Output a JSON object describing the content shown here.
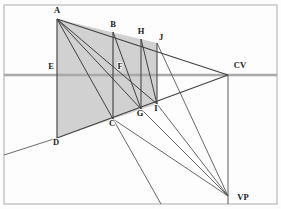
{
  "figure": {
    "type": "perspective-construction-diagram",
    "canvas": {
      "width": 281,
      "height": 209
    },
    "frame": {
      "x": 4,
      "y": 5,
      "width": 273,
      "height": 199,
      "stroke": "#b9b9b9"
    },
    "colors": {
      "background": "#fdfdfd",
      "line": "#4a4a4a",
      "thin_line": "#6d6d6d",
      "horizon": "#a8a8a8",
      "shade_fill": "#c9c9c9",
      "label": "#1a1a1a",
      "frame": "#b9b9b9"
    },
    "horizon_line": {
      "label": "horizon",
      "y": 75,
      "x1": 4,
      "x2": 277
    }
  },
  "points": {
    "A": {
      "label": "A",
      "x": 57,
      "y": 19,
      "label_x": 57,
      "label_y": 11
    },
    "B": {
      "label": "B",
      "x": 113,
      "y": 32,
      "label_x": 113,
      "label_y": 26
    },
    "H": {
      "label": "H",
      "x": 141,
      "y": 39,
      "label_x": 141,
      "label_y": 33
    },
    "J": {
      "label": "J",
      "x": 157,
      "y": 43,
      "label_x": 160,
      "label_y": 39
    },
    "E": {
      "label": "E",
      "x": 57,
      "y": 75,
      "label_x": 52,
      "label_y": 68
    },
    "F": {
      "label": "F",
      "x": 113,
      "y": 75,
      "label_x": 119,
      "label_y": 68
    },
    "CV": {
      "label": "CV",
      "x": 228,
      "y": 75,
      "label_x": 238,
      "label_y": 67
    },
    "C": {
      "label": "C",
      "x": 113,
      "y": 119,
      "label_x": 112,
      "label_y": 124
    },
    "G": {
      "label": "G",
      "x": 141,
      "y": 109,
      "label_x": 140,
      "label_y": 115
    },
    "I": {
      "label": "I",
      "x": 157,
      "y": 104,
      "label_x": 156,
      "label_y": 110
    },
    "D": {
      "label": "D",
      "x": 57,
      "y": 138,
      "label_x": 56,
      "label_y": 144
    },
    "VP": {
      "label": "VP",
      "x": 228,
      "y": 196,
      "label_x": 239,
      "label_y": 199
    }
  },
  "segments": {
    "vertical_AD": {
      "name": "vertical-line-A-D",
      "x1": 57,
      "y1": 19,
      "x2": 57,
      "y2": 138
    },
    "vertical_BC": {
      "name": "vertical-line-B-C",
      "x1": 113,
      "y1": 32,
      "x2": 113,
      "y2": 119
    },
    "vertical_HG": {
      "name": "vertical-line-H-G",
      "x1": 141,
      "y1": 39,
      "x2": 141,
      "y2": 109
    },
    "vertical_JI": {
      "name": "vertical-line-J-I",
      "x1": 157,
      "y1": 43,
      "x2": 157,
      "y2": 104
    },
    "vertical_CVVP": {
      "name": "vertical-line-CV-VP",
      "x1": 228,
      "y1": 75,
      "x2": 228,
      "y2": 204
    },
    "top_A_CV": {
      "name": "line-A-to-CV",
      "x1": 57,
      "y1": 19,
      "x2": 228,
      "y2": 75
    },
    "base_D_CV": {
      "name": "line-D-to-CV",
      "x1": 57,
      "y1": 138,
      "x2": 228,
      "y2": 75
    },
    "ground_left": {
      "name": "ground-line-extension",
      "x1": 4,
      "y1": 155,
      "x2": 57,
      "y2": 138
    },
    "diag_A_C": {
      "name": "diagonal-A-to-C",
      "x1": 57,
      "y1": 19,
      "x2": 113,
      "y2": 119
    },
    "diag_A_G": {
      "name": "diagonal-A-to-G",
      "x1": 57,
      "y1": 19,
      "x2": 141,
      "y2": 109
    },
    "diag_A_I": {
      "name": "diagonal-A-to-I",
      "x1": 57,
      "y1": 19,
      "x2": 157,
      "y2": 104
    },
    "diag_B_G": {
      "name": "diagonal-B-to-G",
      "x1": 113,
      "y1": 32,
      "x2": 141,
      "y2": 109
    },
    "diag_H_I": {
      "name": "diagonal-H-to-I",
      "x1": 141,
      "y1": 39,
      "x2": 157,
      "y2": 104
    },
    "ray_C_VP": {
      "name": "ray-C-to-VP",
      "x1": 113,
      "y1": 119,
      "x2": 228,
      "y2": 196
    },
    "ray_G_VP": {
      "name": "ray-G-to-VP",
      "x1": 141,
      "y1": 109,
      "x2": 228,
      "y2": 196
    },
    "ray_I_VP": {
      "name": "ray-I-to-VP",
      "x1": 157,
      "y1": 104,
      "x2": 228,
      "y2": 196
    },
    "ray_J_VP": {
      "name": "ray-J-to-VP",
      "x1": 157,
      "y1": 43,
      "x2": 228,
      "y2": 196
    },
    "ray_C_bottom": {
      "name": "ray-C-to-bottom-edge",
      "x1": 113,
      "y1": 119,
      "x2": 161,
      "y2": 204
    }
  },
  "shaded_region": {
    "name": "shaded-quadrilateral-A-J-I-D",
    "path": "M 57 19 L 157 43 L 157 104 L 113 119 L 57 138 Z",
    "fill": "#c9c9c9",
    "opacity": 0.85
  },
  "labels_list": [
    "A",
    "B",
    "H",
    "J",
    "E",
    "F",
    "CV",
    "C",
    "G",
    "I",
    "D",
    "VP"
  ]
}
